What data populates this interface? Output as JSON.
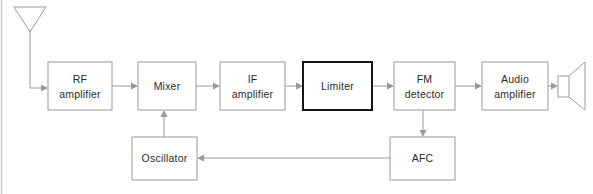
{
  "diagram": {
    "canvas": {
      "width": 593,
      "height": 194,
      "background": "#ffffff"
    },
    "colors": {
      "line": "#9a9a9a",
      "emphasis_border": "#161616",
      "text": "#2b2b2b",
      "block_fill": "#ffffff",
      "page_edge": "#cdcdcd"
    },
    "blocks": [
      {
        "id": "rf-amplifier",
        "label_line1": "RF",
        "label_line2": "amplifier",
        "x": 48,
        "y": 62,
        "width": 64,
        "height": 48,
        "emphasis": false
      },
      {
        "id": "mixer",
        "label_line1": "Mixer",
        "label_line2": "",
        "x": 138,
        "y": 62,
        "width": 58,
        "height": 48,
        "emphasis": false
      },
      {
        "id": "if-amplifier",
        "label_line1": "IF",
        "label_line2": "amplifier",
        "x": 220,
        "y": 62,
        "width": 65,
        "height": 48,
        "emphasis": false
      },
      {
        "id": "limiter",
        "label_line1": "Limiter",
        "label_line2": "",
        "x": 303,
        "y": 62,
        "width": 69,
        "height": 48,
        "emphasis": true
      },
      {
        "id": "fm-detector",
        "label_line1": "FM",
        "label_line2": "detector",
        "x": 394,
        "y": 62,
        "width": 61,
        "height": 48,
        "emphasis": false
      },
      {
        "id": "audio-amplifier",
        "label_line1": "Audio",
        "label_line2": "amplifier",
        "x": 482,
        "y": 62,
        "width": 66,
        "height": 48,
        "emphasis": false
      },
      {
        "id": "oscillator",
        "label_line1": "Oscillator",
        "label_line2": "",
        "x": 132,
        "y": 137,
        "width": 65,
        "height": 43,
        "emphasis": false
      },
      {
        "id": "afc",
        "label_line1": "AFC",
        "label_line2": "",
        "x": 390,
        "y": 137,
        "width": 65,
        "height": 43,
        "emphasis": false
      }
    ],
    "symbols": [
      {
        "id": "antenna",
        "name": "antenna-symbol",
        "description": "dipole V antenna at top left"
      },
      {
        "id": "loudspeaker",
        "name": "loudspeaker-symbol",
        "description": "speaker cone at right edge"
      }
    ],
    "connections": [
      {
        "id": "antenna-to-rf",
        "from": "antenna",
        "to": "rf-amplifier",
        "arrow": true
      },
      {
        "id": "rf-to-mixer",
        "from": "rf-amplifier",
        "to": "mixer",
        "arrow": true
      },
      {
        "id": "mixer-to-if",
        "from": "mixer",
        "to": "if-amplifier",
        "arrow": true
      },
      {
        "id": "if-to-limiter",
        "from": "if-amplifier",
        "to": "limiter",
        "arrow": true
      },
      {
        "id": "limiter-to-fm-detector",
        "from": "limiter",
        "to": "fm-detector",
        "arrow": true
      },
      {
        "id": "fm-detector-to-audio",
        "from": "fm-detector",
        "to": "audio-amplifier",
        "arrow": true
      },
      {
        "id": "audio-to-speaker",
        "from": "audio-amplifier",
        "to": "loudspeaker",
        "arrow": true
      },
      {
        "id": "oscillator-to-mixer",
        "from": "oscillator",
        "to": "mixer",
        "arrow": true
      },
      {
        "id": "fm-detector-to-afc",
        "from": "fm-detector",
        "to": "afc",
        "arrow": true
      },
      {
        "id": "afc-to-oscillator",
        "from": "afc",
        "to": "oscillator",
        "arrow": true
      }
    ]
  }
}
